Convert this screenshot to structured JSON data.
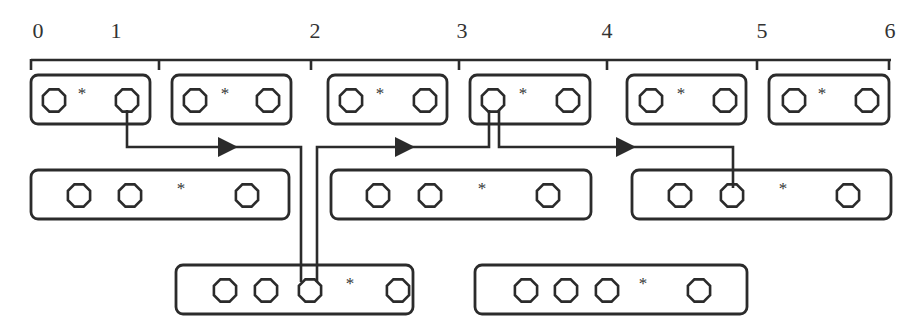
{
  "diagram": {
    "type": "interval-allocation diagram",
    "stroke_color": "#2b2b2b",
    "scale": {
      "y": 60,
      "x_start": 31,
      "x_end": 891,
      "ticks": [
        {
          "x": 31,
          "label": "0",
          "label_x": 38
        },
        {
          "x": 159,
          "label": "1",
          "label_x": 116
        },
        {
          "x": 311,
          "label": "2",
          "label_x": 315
        },
        {
          "x": 459,
          "label": "3",
          "label_x": 462
        },
        {
          "x": 607,
          "label": "4",
          "label_x": 607
        },
        {
          "x": 757,
          "label": "5",
          "label_x": 762
        },
        {
          "x": 889,
          "label": "6",
          "label_x": 890
        }
      ]
    },
    "rows": [
      {
        "name": "row-1",
        "y": 75,
        "h": 49,
        "boxes": [
          {
            "x": 31,
            "w": 119,
            "slots": [
              {
                "t": "o",
                "x": 54
              },
              {
                "t": "*",
                "x": 82
              },
              {
                "t": "o",
                "x": 127
              }
            ]
          },
          {
            "x": 172,
            "w": 119,
            "slots": [
              {
                "t": "o",
                "x": 195
              },
              {
                "t": "*",
                "x": 225
              },
              {
                "t": "o",
                "x": 268
              }
            ]
          },
          {
            "x": 328,
            "w": 119,
            "slots": [
              {
                "t": "o",
                "x": 351
              },
              {
                "t": "*",
                "x": 380
              },
              {
                "t": "o",
                "x": 425
              }
            ]
          },
          {
            "x": 470,
            "w": 120,
            "slots": [
              {
                "t": "o",
                "x": 493
              },
              {
                "t": "*",
                "x": 523
              },
              {
                "t": "o",
                "x": 568
              }
            ]
          },
          {
            "x": 627,
            "w": 119,
            "slots": [
              {
                "t": "o",
                "x": 651
              },
              {
                "t": "*",
                "x": 681
              },
              {
                "t": "o",
                "x": 725
              }
            ]
          },
          {
            "x": 769,
            "w": 120,
            "slots": [
              {
                "t": "o",
                "x": 794
              },
              {
                "t": "*",
                "x": 822
              },
              {
                "t": "o",
                "x": 867
              }
            ]
          }
        ]
      },
      {
        "name": "row-2",
        "y": 170,
        "h": 49,
        "boxes": [
          {
            "x": 31,
            "w": 258,
            "slots": [
              {
                "t": "o",
                "x": 79
              },
              {
                "t": "o",
                "x": 130
              },
              {
                "t": "*",
                "x": 181
              },
              {
                "t": "o",
                "x": 247
              }
            ]
          },
          {
            "x": 331,
            "w": 260,
            "slots": [
              {
                "t": "o",
                "x": 378
              },
              {
                "t": "o",
                "x": 430
              },
              {
                "t": "*",
                "x": 482
              },
              {
                "t": "o",
                "x": 548
              }
            ]
          },
          {
            "x": 632,
            "w": 259,
            "slots": [
              {
                "t": "o",
                "x": 680
              },
              {
                "t": "o",
                "x": 732
              },
              {
                "t": "*",
                "x": 783
              },
              {
                "t": "o",
                "x": 848
              }
            ]
          }
        ]
      },
      {
        "name": "row-3",
        "y": 265,
        "h": 49,
        "boxes": [
          {
            "x": 176,
            "w": 237,
            "slots": [
              {
                "t": "o",
                "x": 225
              },
              {
                "t": "o",
                "x": 266
              },
              {
                "t": "o",
                "x": 310
              },
              {
                "t": "*",
                "x": 350
              },
              {
                "t": "o",
                "x": 398
              }
            ]
          },
          {
            "x": 475,
            "w": 272,
            "slots": [
              {
                "t": "o",
                "x": 526
              },
              {
                "t": "o",
                "x": 566
              },
              {
                "t": "o",
                "x": 607
              },
              {
                "t": "*",
                "x": 643
              },
              {
                "t": "o",
                "x": 699
              }
            ]
          }
        ]
      }
    ],
    "connectors": [
      {
        "name": "connector-box1-to-row3",
        "points": [
          [
            127,
            110
          ],
          [
            127,
            147
          ],
          [
            301,
            147
          ],
          [
            301,
            282
          ]
        ],
        "arrow": {
          "x": 228,
          "y": 147
        }
      },
      {
        "name": "connector-box4a-to-row3",
        "points": [
          [
            489,
            110
          ],
          [
            489,
            147
          ],
          [
            317,
            147
          ],
          [
            317,
            282
          ]
        ],
        "arrow": {
          "x": 405,
          "y": 147
        }
      },
      {
        "name": "connector-box4b-to-row2",
        "points": [
          [
            499,
            110
          ],
          [
            499,
            147
          ],
          [
            733,
            147
          ],
          [
            733,
            188
          ]
        ],
        "arrow": {
          "x": 626,
          "y": 147
        }
      }
    ]
  }
}
